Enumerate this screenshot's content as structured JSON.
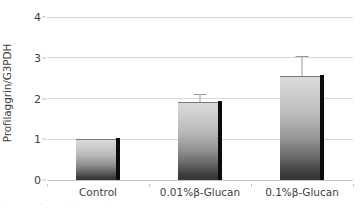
{
  "chart_data": {
    "type": "bar",
    "title": "",
    "xlabel": "",
    "ylabel": "Profilaggrin/G3PDH",
    "categories": [
      "Control",
      "0.01%β-Glucan",
      "0.1%β-Glucan"
    ],
    "values": [
      1.0,
      1.91,
      2.55
    ],
    "errors": [
      0,
      0.21,
      0.49
    ],
    "ylim": [
      0,
      4
    ],
    "yticks": [
      0,
      1,
      2,
      3,
      4
    ],
    "ytick_labels": [
      "0",
      "1",
      "2",
      "3",
      "4"
    ],
    "grid": "horizontal",
    "legend": "none",
    "series": [
      {
        "name": "Profilaggrin/G3PDH",
        "values": [
          1.0,
          1.91,
          2.55
        ],
        "errors": [
          0,
          0.21,
          0.49
        ]
      }
    ],
    "bar_style": {
      "fill": "vertical-gradient-light-to-dark-gray",
      "gradient_top": "#d9d9d9",
      "gradient_bottom": "#333333",
      "shadow_edge": "#0b0b0b",
      "error_bar_color": "#9a9a9a",
      "gridline_color": "#d8d8d8",
      "background": "#ffffff",
      "text_color": "#3f3f3f"
    }
  },
  "axes": {
    "y_title": "Profilaggrin/G3PDH",
    "y_ticks": [
      {
        "label": "4",
        "value": 4
      },
      {
        "label": "3",
        "value": 3
      },
      {
        "label": "2",
        "value": 2
      },
      {
        "label": "1",
        "value": 1
      },
      {
        "label": "0",
        "value": 0
      }
    ],
    "x_ticks": [
      {
        "label": "Control"
      },
      {
        "label": "0.01%β-Glucan"
      },
      {
        "label": "0.1%β-Glucan"
      }
    ]
  },
  "caption_sliver": "partially cropped caption text"
}
